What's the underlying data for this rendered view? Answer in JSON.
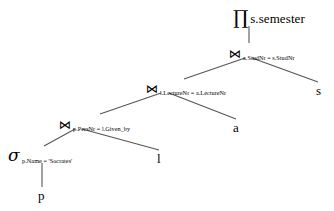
{
  "diagram": {
    "background_color": "#ffffff",
    "stroke_color": "#555555",
    "text_color": "#000000",
    "nodes": {
      "projection": {
        "operator_symbol": "∏",
        "operator_name": "projection",
        "argument": "s.semester"
      },
      "join_stud": {
        "operator_symbol": "⋈",
        "operator_name": "join",
        "argument": "a.StudNr = s.StudNr"
      },
      "join_lecture": {
        "operator_symbol": "⋈",
        "operator_name": "join",
        "argument": "l.LectureNr = a.LectureNr"
      },
      "join_pers": {
        "operator_symbol": "⋈",
        "operator_name": "join",
        "argument": "p.PersNr = l.Given_by"
      },
      "selection": {
        "operator_symbol": "σ",
        "operator_name": "selection",
        "argument": "p.Name = 'Socrates'"
      }
    },
    "leaves": {
      "p": "p",
      "l": "l",
      "a": "a",
      "s": "s"
    }
  }
}
